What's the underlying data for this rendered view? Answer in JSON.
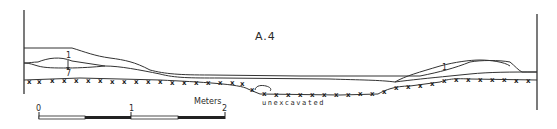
{
  "diagram": {
    "title": "A.4",
    "layer_labels": [
      {
        "text": "1",
        "x": 67,
        "y": 57
      },
      {
        "text": "7",
        "x": 67,
        "y": 76
      },
      {
        "text": "1",
        "x": 442,
        "y": 69
      }
    ],
    "annotation": "unexcavated",
    "scale_bar": {
      "unit_label": "Meters",
      "tick_labels": [
        "0",
        "1",
        "2"
      ]
    },
    "colors": {
      "ink": "#2a2a2a",
      "background": "#ffffff"
    }
  }
}
